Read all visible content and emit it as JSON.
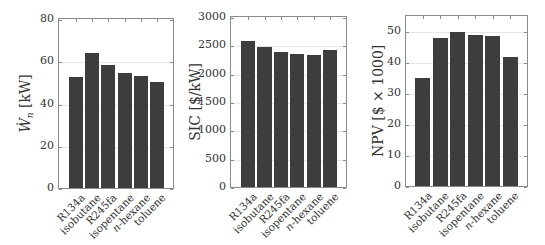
{
  "chart_data": [
    {
      "type": "bar",
      "title": "",
      "xlabel": "",
      "ylabel": "Ẇn [kW]",
      "ylim": [
        0,
        80
      ],
      "yticks": [
        0,
        20,
        40,
        60,
        80
      ],
      "grid": true,
      "categories": [
        "R134a",
        "isobutane",
        "R245fa",
        "isopentane",
        "n-hexane",
        "toluene"
      ],
      "values": [
        52.5,
        64,
        58,
        54.5,
        53,
        50
      ],
      "bar_color": "#3d3d3d"
    },
    {
      "type": "bar",
      "title": "",
      "xlabel": "",
      "ylabel": "SIC [$/kW]",
      "ylim": [
        0,
        3000
      ],
      "yticks": [
        0,
        500,
        1000,
        1500,
        2000,
        2500,
        3000
      ],
      "grid": true,
      "categories": [
        "R134a",
        "isobutane",
        "R245fa",
        "isopentane",
        "n-hexane",
        "toluene"
      ],
      "values": [
        2570,
        2465,
        2380,
        2350,
        2325,
        2410
      ],
      "bar_color": "#3d3d3d"
    },
    {
      "type": "bar",
      "title": "",
      "xlabel": "",
      "ylabel": "NPV [$ × 1000]",
      "ylim": [
        0,
        55
      ],
      "yticks": [
        0,
        10,
        20,
        30,
        40,
        50
      ],
      "grid": true,
      "categories": [
        "R134a",
        "isobutane",
        "R245fa",
        "isopentane",
        "n-hexane",
        "toluene"
      ],
      "values": [
        34.8,
        47.8,
        49.7,
        48.7,
        48.4,
        41.6
      ],
      "bar_color": "#3d3d3d"
    }
  ],
  "charts": {
    "c1": {
      "ylabel_main": "Ẇ",
      "ylabel_sub": "n",
      "ylabel_unit": " [kW]",
      "yticks": [
        "0",
        "20",
        "40",
        "60",
        "80"
      ]
    },
    "c2": {
      "ylabel": "SIC [$/kW]",
      "yticks": [
        "0",
        "500",
        "1000",
        "1500",
        "2000",
        "2500",
        "3000"
      ]
    },
    "c3": {
      "ylabel": "NPV [$ × 1000]",
      "yticks": [
        "0",
        "10",
        "20",
        "30",
        "40",
        "50"
      ]
    },
    "categories": [
      "R134a",
      "isobutane",
      "R245fa",
      "isopentane",
      "n-hexane",
      "toluene"
    ],
    "categories_italic_prefix": [
      "",
      "",
      "",
      "",
      "n",
      ""
    ],
    "categories_rest": [
      "R134a",
      "isobutane",
      "R245fa",
      "isopentane",
      "-hexane",
      "toluene"
    ]
  }
}
